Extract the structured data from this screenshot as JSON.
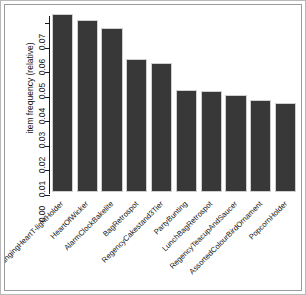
{
  "chart_data": {
    "type": "bar",
    "title": "",
    "subtitle": "",
    "xlabel": "",
    "ylabel": "item frequency (relative)",
    "ylim": [
      0.0,
      0.073
    ],
    "yticks": [
      "0.00",
      "0.01",
      "0.02",
      "0.03",
      "0.04",
      "0.05",
      "0.06",
      "0.07"
    ],
    "ytick_values": [
      0.0,
      0.01,
      0.02,
      0.03,
      0.04,
      0.05,
      0.06,
      0.07
    ],
    "grid": false,
    "legend": "none",
    "bar_color": "#383838",
    "bar_border_color": "#cfcfcf",
    "axis_color": "#1a1a1a",
    "background_color": "#ffffff",
    "categories": [
      "WhiteHangingHeartT-lightHolder",
      "HeartOfWicker",
      "AlarmClockBakelite",
      "BagRetrospot",
      "RegencyCakestand3Tier",
      "PartyBunting",
      "LunchBagRetrospot",
      "RegencyTeacupAndSaucer",
      "AssortedColourBirdOrnament",
      "PopcornHolder"
    ],
    "values": [
      0.0725,
      0.0702,
      0.0668,
      0.0543,
      0.0525,
      0.0415,
      0.041,
      0.0397,
      0.0375,
      0.0362
    ]
  },
  "axis": {
    "y_title": "item frequency (relative)"
  }
}
